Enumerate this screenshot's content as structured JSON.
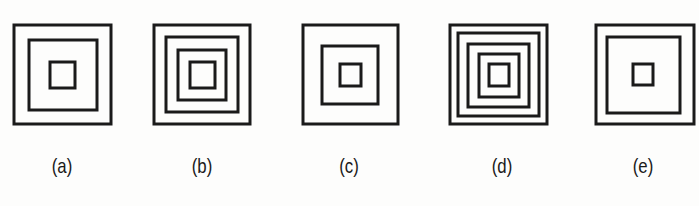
{
  "figure": {
    "stroke_color": "#1a1a1a",
    "stroke_width": 3,
    "options": [
      {
        "label": "(a)",
        "label_x": 62,
        "squares": [
          {
            "x": 14,
            "y": 25,
            "w": 97,
            "h": 99
          },
          {
            "x": 29,
            "y": 40,
            "w": 68,
            "h": 70
          },
          {
            "x": 50,
            "y": 62,
            "w": 25,
            "h": 26
          }
        ]
      },
      {
        "label": "(b)",
        "label_x": 202,
        "squares": [
          {
            "x": 154,
            "y": 25,
            "w": 96,
            "h": 99
          },
          {
            "x": 166,
            "y": 37,
            "w": 72,
            "h": 75
          },
          {
            "x": 178,
            "y": 50,
            "w": 48,
            "h": 50
          },
          {
            "x": 190,
            "y": 62,
            "w": 25,
            "h": 26
          }
        ]
      },
      {
        "label": "(c)",
        "label_x": 349,
        "squares": [
          {
            "x": 303,
            "y": 25,
            "w": 95,
            "h": 99
          },
          {
            "x": 322,
            "y": 46,
            "w": 56,
            "h": 58
          },
          {
            "x": 340,
            "y": 64,
            "w": 21,
            "h": 22
          }
        ]
      },
      {
        "label": "(d)",
        "label_x": 502,
        "squares": [
          {
            "x": 450,
            "y": 25,
            "w": 97,
            "h": 99
          },
          {
            "x": 458,
            "y": 33,
            "w": 81,
            "h": 83
          },
          {
            "x": 468,
            "y": 44,
            "w": 61,
            "h": 63
          },
          {
            "x": 479,
            "y": 54,
            "w": 40,
            "h": 43
          },
          {
            "x": 489,
            "y": 64,
            "w": 20,
            "h": 22
          }
        ]
      },
      {
        "label": "(e)",
        "label_x": 643,
        "squares": [
          {
            "x": 596,
            "y": 25,
            "w": 98,
            "h": 99
          },
          {
            "x": 607,
            "y": 37,
            "w": 73,
            "h": 76
          },
          {
            "x": 633,
            "y": 64,
            "w": 20,
            "h": 21
          }
        ]
      }
    ]
  }
}
